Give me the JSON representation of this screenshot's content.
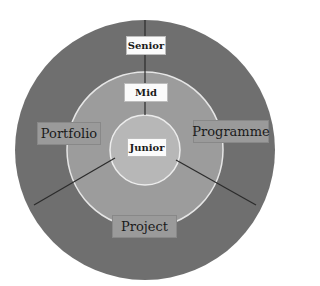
{
  "diagram": {
    "levels": [
      {
        "label": "Senior",
        "ring": "outer",
        "color": "#6f6f6f"
      },
      {
        "label": "Mid",
        "ring": "middle",
        "color": "#9c9c9c"
      },
      {
        "label": "Junior",
        "ring": "inner",
        "color": "#b7b7b7"
      }
    ],
    "domains": [
      {
        "label": "Portfolio",
        "position": "left"
      },
      {
        "label": "Programme",
        "position": "right"
      },
      {
        "label": "Project",
        "position": "bottom"
      }
    ],
    "ring_border_color": "#e6e6e6",
    "divider_color": "#2b2b2b"
  }
}
